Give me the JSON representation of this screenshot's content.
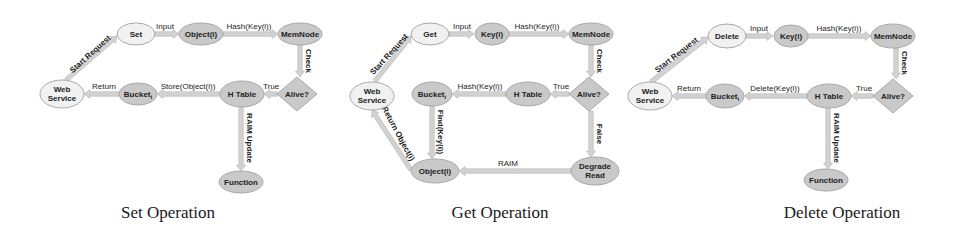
{
  "colors": {
    "node_dark": "#c9c9c9",
    "node_light": "#f1f1f1",
    "node_stroke": "#a9a9a9",
    "arrow": "#d2d2d2",
    "arrow_stroke": "#b3b3b3",
    "text": "#222222"
  },
  "diagrams": [
    {
      "caption": "Set Operation",
      "caption_x": 168,
      "nodes": [
        {
          "id": "web",
          "label": [
            "Web",
            "Service"
          ],
          "shape": "ellipse",
          "cx": 62,
          "cy": 94,
          "rx": 22,
          "ry": 14,
          "style": "light"
        },
        {
          "id": "op",
          "label": [
            "Set"
          ],
          "shape": "ellipse",
          "cx": 136,
          "cy": 34,
          "rx": 19,
          "ry": 11,
          "style": "light"
        },
        {
          "id": "obj",
          "label": [
            "Object(i)"
          ],
          "shape": "ellipse",
          "cx": 201,
          "cy": 34,
          "rx": 22,
          "ry": 11,
          "style": "dark"
        },
        {
          "id": "mem",
          "label": [
            "MemNode"
          ],
          "shape": "ellipse",
          "cx": 300,
          "cy": 34,
          "rx": 22,
          "ry": 11,
          "style": "dark"
        },
        {
          "id": "alive",
          "label": [
            "Alive?"
          ],
          "shape": "diamond",
          "cx": 297,
          "cy": 94,
          "rx": 20,
          "ry": 17,
          "style": "dark"
        },
        {
          "id": "htable",
          "label": [
            "H Table"
          ],
          "shape": "ellipse",
          "cx": 242,
          "cy": 94,
          "rx": 22,
          "ry": 13,
          "style": "dark"
        },
        {
          "id": "bucket",
          "label": [
            "Bucket_i"
          ],
          "shape": "ellipse",
          "cx": 138,
          "cy": 94,
          "rx": 19,
          "ry": 11,
          "style": "dark"
        },
        {
          "id": "func",
          "label": [
            "Function"
          ],
          "shape": "ellipse",
          "cx": 241,
          "cy": 182,
          "rx": 22,
          "ry": 11,
          "style": "dark"
        }
      ],
      "edges": [
        {
          "from": [
            66,
            80
          ],
          "to": [
            117,
            36
          ],
          "label": "Start Request",
          "rotate": -42,
          "lx": 92,
          "ly": 56
        },
        {
          "from": [
            155,
            34
          ],
          "to": [
            179,
            34
          ],
          "label": "Input",
          "lx": 165,
          "ly": 29
        },
        {
          "from": [
            223,
            34
          ],
          "to": [
            278,
            34
          ],
          "label": "Hash(Key(i))",
          "lx": 249,
          "ly": 29
        },
        {
          "from": [
            300,
            45
          ],
          "to": [
            300,
            77
          ],
          "label": "Check",
          "rotate": 90,
          "lx": 306,
          "ly": 61
        },
        {
          "from": [
            277,
            94
          ],
          "to": [
            264,
            94
          ],
          "label": "True",
          "lx": 271,
          "ly": 89
        },
        {
          "from": [
            220,
            94
          ],
          "to": [
            157,
            94
          ],
          "label": "Store(Object(i))",
          "lx": 188,
          "ly": 89
        },
        {
          "from": [
            119,
            94
          ],
          "to": [
            84,
            94
          ],
          "label": "Return",
          "lx": 104,
          "ly": 89
        },
        {
          "from": [
            241,
            107
          ],
          "to": [
            241,
            171
          ],
          "label": "RAIM Update",
          "rotate": 90,
          "lx": 247,
          "ly": 138
        }
      ]
    },
    {
      "caption": "Get Operation",
      "caption_x": 500,
      "nodes": [
        {
          "id": "web",
          "label": [
            "Web",
            "Service"
          ],
          "shape": "ellipse",
          "cx": 372,
          "cy": 96,
          "rx": 22,
          "ry": 14,
          "style": "light"
        },
        {
          "id": "op",
          "label": [
            "Get"
          ],
          "shape": "ellipse",
          "cx": 430,
          "cy": 34,
          "rx": 19,
          "ry": 11,
          "style": "light"
        },
        {
          "id": "key",
          "label": [
            "Key(i)"
          ],
          "shape": "ellipse",
          "cx": 492,
          "cy": 34,
          "rx": 17,
          "ry": 11,
          "style": "dark"
        },
        {
          "id": "mem",
          "label": [
            "MemNode"
          ],
          "shape": "ellipse",
          "cx": 591,
          "cy": 34,
          "rx": 22,
          "ry": 11,
          "style": "dark"
        },
        {
          "id": "alive",
          "label": [
            "Alive?"
          ],
          "shape": "diamond",
          "cx": 589,
          "cy": 94,
          "rx": 20,
          "ry": 17,
          "style": "dark"
        },
        {
          "id": "htable",
          "label": [
            "H Table"
          ],
          "shape": "ellipse",
          "cx": 528,
          "cy": 94,
          "rx": 22,
          "ry": 12,
          "style": "dark"
        },
        {
          "id": "bucket",
          "label": [
            "Bucket_i"
          ],
          "shape": "ellipse",
          "cx": 432,
          "cy": 94,
          "rx": 20,
          "ry": 12,
          "style": "dark"
        },
        {
          "id": "obj",
          "label": [
            "Object(i)"
          ],
          "shape": "ellipse",
          "cx": 435,
          "cy": 171,
          "rx": 24,
          "ry": 12,
          "style": "dark"
        },
        {
          "id": "degrade",
          "label": [
            "Degrade",
            "Read"
          ],
          "shape": "ellipse",
          "cx": 595,
          "cy": 171,
          "rx": 24,
          "ry": 14,
          "style": "dark"
        }
      ],
      "edges": [
        {
          "from": [
            375,
            81
          ],
          "to": [
            411,
            36
          ],
          "label": "Start Request",
          "rotate": -48,
          "lx": 391,
          "ly": 56
        },
        {
          "from": [
            449,
            34
          ],
          "to": [
            474,
            34
          ],
          "label": "Input",
          "lx": 462,
          "ly": 29
        },
        {
          "from": [
            509,
            34
          ],
          "to": [
            569,
            34
          ],
          "label": "Hash(Key(i))",
          "lx": 537,
          "ly": 29
        },
        {
          "from": [
            591,
            45
          ],
          "to": [
            591,
            77
          ],
          "label": "Check",
          "rotate": 90,
          "lx": 597,
          "ly": 61
        },
        {
          "from": [
            569,
            94
          ],
          "to": [
            550,
            94
          ],
          "label": "True",
          "lx": 561,
          "ly": 89
        },
        {
          "from": [
            506,
            94
          ],
          "to": [
            452,
            94
          ],
          "label": "Hash(Key(i))",
          "lx": 480,
          "ly": 89
        },
        {
          "from": [
            432,
            106
          ],
          "to": [
            432,
            159
          ],
          "label": "Find(Key(i))",
          "rotate": 90,
          "lx": 438,
          "ly": 132
        },
        {
          "from": [
            591,
            111
          ],
          "to": [
            591,
            157
          ],
          "label": "False",
          "rotate": 90,
          "lx": 597,
          "ly": 134
        },
        {
          "from": [
            571,
            171
          ],
          "to": [
            459,
            171
          ],
          "label": "RAIM",
          "lx": 508,
          "ly": 166
        },
        {
          "from": [
            411,
            170
          ],
          "to": [
            372,
            110
          ],
          "label": "Return Object(i)",
          "rotate": 62,
          "lx": 396,
          "ly": 135
        }
      ]
    },
    {
      "caption": "Delete Operation",
      "caption_x": 842,
      "nodes": [
        {
          "id": "web",
          "label": [
            "Web",
            "Service"
          ],
          "shape": "ellipse",
          "cx": 650,
          "cy": 96,
          "rx": 22,
          "ry": 14,
          "style": "light"
        },
        {
          "id": "op",
          "label": [
            "Delete"
          ],
          "shape": "ellipse",
          "cx": 727,
          "cy": 36,
          "rx": 19,
          "ry": 12,
          "style": "light"
        },
        {
          "id": "key",
          "label": [
            "Key(i)"
          ],
          "shape": "ellipse",
          "cx": 791,
          "cy": 36,
          "rx": 17,
          "ry": 11,
          "style": "dark"
        },
        {
          "id": "mem",
          "label": [
            "MemNode"
          ],
          "shape": "ellipse",
          "cx": 893,
          "cy": 36,
          "rx": 22,
          "ry": 12,
          "style": "dark"
        },
        {
          "id": "alive",
          "label": [
            "Alive?"
          ],
          "shape": "diamond",
          "cx": 893,
          "cy": 96,
          "rx": 20,
          "ry": 17,
          "style": "dark"
        },
        {
          "id": "htable",
          "label": [
            "H Table"
          ],
          "shape": "ellipse",
          "cx": 829,
          "cy": 96,
          "rx": 22,
          "ry": 12,
          "style": "dark"
        },
        {
          "id": "bucket",
          "label": [
            "Bucket_i"
          ],
          "shape": "ellipse",
          "cx": 725,
          "cy": 96,
          "rx": 19,
          "ry": 12,
          "style": "dark"
        },
        {
          "id": "func",
          "label": [
            "Function"
          ],
          "shape": "ellipse",
          "cx": 826,
          "cy": 180,
          "rx": 22,
          "ry": 11,
          "style": "dark"
        }
      ],
      "edges": [
        {
          "from": [
            651,
            82
          ],
          "to": [
            708,
            37
          ],
          "label": "Start Request",
          "rotate": -38,
          "lx": 678,
          "ly": 57
        },
        {
          "from": [
            746,
            36
          ],
          "to": [
            773,
            36
          ],
          "label": "Input",
          "lx": 759,
          "ly": 31
        },
        {
          "from": [
            808,
            36
          ],
          "to": [
            871,
            36
          ],
          "label": "Hash(Key(i))",
          "lx": 839,
          "ly": 31
        },
        {
          "from": [
            896,
            48
          ],
          "to": [
            896,
            79
          ],
          "label": "Check",
          "rotate": 90,
          "lx": 902,
          "ly": 63
        },
        {
          "from": [
            873,
            96
          ],
          "to": [
            851,
            96
          ],
          "label": "True",
          "lx": 864,
          "ly": 91
        },
        {
          "from": [
            807,
            96
          ],
          "to": [
            744,
            96
          ],
          "label": "Delete(Key(i))",
          "lx": 775,
          "ly": 91
        },
        {
          "from": [
            706,
            96
          ],
          "to": [
            672,
            96
          ],
          "label": "Return",
          "lx": 689,
          "ly": 91
        },
        {
          "from": [
            828,
            108
          ],
          "to": [
            828,
            169
          ],
          "label": "RAIM Update",
          "rotate": 90,
          "lx": 834,
          "ly": 138
        }
      ]
    }
  ]
}
